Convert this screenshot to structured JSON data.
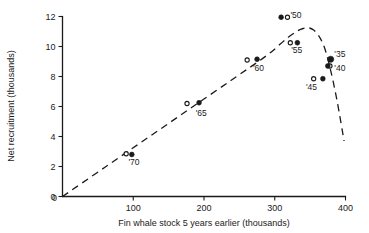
{
  "chart_data": {
    "type": "scatter",
    "title": "",
    "xlabel": "Fin whale stock 5 years earlier (thousands)",
    "ylabel": "Net recruitment (thousands)",
    "xlim": [
      0,
      400
    ],
    "ylim": [
      0,
      12
    ],
    "xticks": [
      0,
      100,
      200,
      300,
      400
    ],
    "xticklabels": [
      "0",
      "100",
      "200",
      "300",
      "400"
    ],
    "yticks": [
      0,
      2,
      4,
      6,
      8,
      10,
      12
    ],
    "yticklabels": [
      "0",
      "2",
      "4",
      "6",
      "8",
      "10",
      "12"
    ],
    "grid": false,
    "legend": "none",
    "series": [
      {
        "name": "Observed (open circle)",
        "marker": "open-circle",
        "points": [
          {
            "label": "'70",
            "x": 90,
            "y": 2.85
          },
          {
            "label": "'65",
            "x": 176,
            "y": 6.2
          },
          {
            "label": "'60",
            "x": 261,
            "y": 9.1
          },
          {
            "label": "'55",
            "x": 322,
            "y": 10.25
          },
          {
            "label": "'45",
            "x": 355,
            "y": 7.85
          },
          {
            "label": "'40",
            "x": 378,
            "y": 8.7
          },
          {
            "label": "'50",
            "x": 318,
            "y": 11.95
          }
        ]
      },
      {
        "name": "Fitted (filled circle)",
        "marker": "filled-circle",
        "points": [
          {
            "label": "'70",
            "x": 98,
            "y": 2.8
          },
          {
            "label": "'65",
            "x": 193,
            "y": 6.25
          },
          {
            "label": "'60",
            "x": 275,
            "y": 9.15
          },
          {
            "label": "'55",
            "x": 332,
            "y": 10.25
          },
          {
            "label": "'45",
            "x": 368,
            "y": 7.85
          },
          {
            "label": "'35",
            "x": 379,
            "y": 9.15
          },
          {
            "label": "'40",
            "x": 375,
            "y": 8.7
          },
          {
            "label": "'50",
            "x": 309,
            "y": 11.95
          }
        ]
      }
    ],
    "annotations": [
      {
        "text": "'50",
        "x": 330,
        "y": 11.9
      },
      {
        "text": "'55",
        "x": 331,
        "y": 9.55
      },
      {
        "text": "'35",
        "x": 392,
        "y": 9.3
      },
      {
        "text": "'40",
        "x": 392,
        "y": 8.35
      },
      {
        "text": "'45",
        "x": 352,
        "y": 7.1
      },
      {
        "text": "'60",
        "x": 277,
        "y": 8.35
      },
      {
        "text": "'65",
        "x": 196,
        "y": 5.4
      },
      {
        "text": "'70",
        "x": 101,
        "y": 2.1
      }
    ],
    "fit_curve": {
      "style": "dashed",
      "description": "Dashed recruitment curve rising linearly from origin to a peak near stock 335 then falling steeply",
      "points": [
        {
          "x": 0,
          "y": 0
        },
        {
          "x": 60,
          "y": 1.95
        },
        {
          "x": 120,
          "y": 3.9
        },
        {
          "x": 180,
          "y": 5.85
        },
        {
          "x": 240,
          "y": 7.8
        },
        {
          "x": 290,
          "y": 9.45
        },
        {
          "x": 320,
          "y": 10.65
        },
        {
          "x": 340,
          "y": 11.2
        },
        {
          "x": 355,
          "y": 11.1
        },
        {
          "x": 368,
          "y": 10.2
        },
        {
          "x": 378,
          "y": 8.6
        },
        {
          "x": 388,
          "y": 6.4
        },
        {
          "x": 398,
          "y": 3.7
        }
      ]
    }
  }
}
